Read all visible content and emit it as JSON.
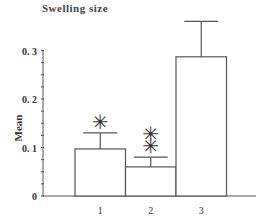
{
  "chart_data": {
    "type": "bar",
    "title": "Swelling size",
    "xlabel": "",
    "ylabel": "Mean",
    "categories": [
      "1",
      "2",
      "3"
    ],
    "values": [
      0.097,
      0.06,
      0.287
    ],
    "error_upper": [
      0.13,
      0.08,
      0.36
    ],
    "annotations": [
      {
        "category": "1",
        "text": "*"
      },
      {
        "category": "2",
        "text": "**"
      }
    ],
    "ylim": [
      0,
      0.35
    ],
    "yticks": [
      "0",
      "0.1",
      "0.2",
      "0.3"
    ],
    "grid": false,
    "legend": null,
    "colors": {
      "bar_fill": "#ffffff",
      "bar_stroke": "#555555"
    }
  }
}
